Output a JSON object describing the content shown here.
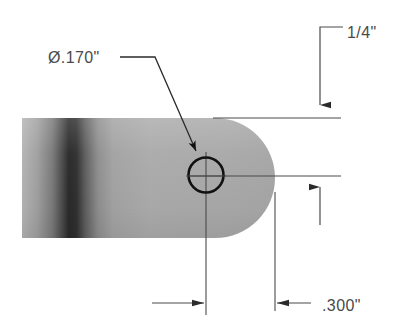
{
  "drawing": {
    "title": "Bracket end detail with hole",
    "background_color": "#ffffff",
    "part": {
      "name": "flat-bar-with-rounded-end",
      "fill_color": "#a8a8a8",
      "shadow_dark_color": "#1c1c1c",
      "left_x": 22,
      "right_x": 275,
      "top_y": 118,
      "bottom_y": 238,
      "corner_radius": 60
    },
    "hole": {
      "name": "through-hole",
      "center_x": 206,
      "center_y": 175,
      "radius": 18,
      "stroke_color": "#111111"
    },
    "line_color": "#4a4a4a"
  },
  "annotations": {
    "diameter_callout": {
      "label": "Ø.170\"",
      "text_x": 48,
      "text_y": 63,
      "leader_start_x": 120,
      "leader_start_y": 57,
      "leader_bend_x": 155,
      "leader_end_x": 196,
      "leader_end_y": 152
    },
    "edge_distance_top": {
      "label": "1/4\"",
      "text_x": 347,
      "text_y": 38,
      "leader_corner_x": 320,
      "leader_corner_y": 27,
      "leader_text_x": 343,
      "dim_line_x": 320,
      "dim_line_top_y": 27,
      "arrow_tip_y": 116
    },
    "edge_distance_bottom": {
      "label": ".300\"",
      "text_x": 322,
      "text_y": 311,
      "leader_start_x": 300,
      "leader_start_y": 304,
      "arrow_left_x": 275,
      "arrow_right_x": 206,
      "dim_line_y": 303
    }
  },
  "dimension_values": {
    "hole_diameter": ".170",
    "top_edge_distance": "1/4",
    "side_edge_distance": ".300",
    "units": "inches"
  }
}
